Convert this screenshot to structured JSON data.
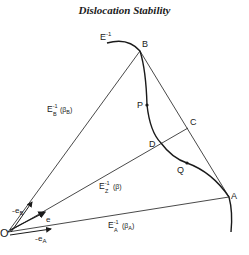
{
  "title": "Dislocation Stability",
  "colors": {
    "ink": "#1a1a1a",
    "background": "#ffffff"
  },
  "diagram": {
    "curve_label": {
      "base": "E",
      "sup": "-1"
    },
    "points": {
      "O": "O",
      "B": "B",
      "A": "A",
      "C": "C",
      "D": "D",
      "P": "P",
      "Q": "Q"
    },
    "line_labels": {
      "OB": {
        "base": "E",
        "sup": "-1",
        "sub": "B",
        "arg": "(β",
        "argsub": "B",
        "close": ")"
      },
      "OZ": {
        "base": "E",
        "sup": "-1",
        "sub": "Z",
        "arg": "(β)"
      },
      "OA": {
        "base": "E",
        "sup": "-1",
        "sub": "A",
        "arg": "(β",
        "argsub": "A",
        "close": ")"
      }
    },
    "vectors": {
      "eB": {
        "base": "e",
        "sub": "B",
        "tilde": "~"
      },
      "e": {
        "base": "e",
        "tilde": "~"
      },
      "eA": {
        "base": "e",
        "sub": "A",
        "tilde": "~"
      }
    }
  }
}
